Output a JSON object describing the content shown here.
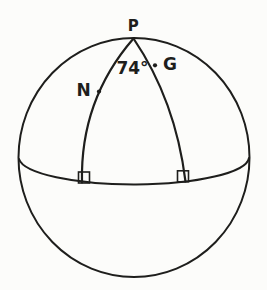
{
  "figure": {
    "labels": {
      "pole": "P",
      "left_point": "N",
      "right_point": "G",
      "angle_at_pole": "74°"
    },
    "colors": {
      "line": "#1e1e1c",
      "background": "#fcfcfa"
    }
  }
}
